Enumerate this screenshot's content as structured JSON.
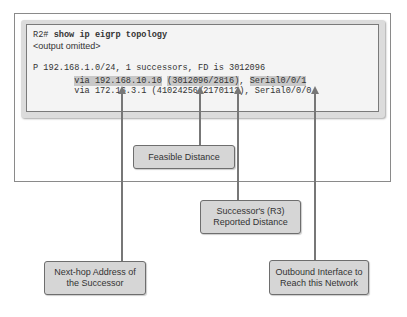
{
  "terminal": {
    "prompt": "R2#",
    "command": " show ip eigrp topology",
    "omitted": "<output omitted>",
    "route_line": "P 192.168.1.0/24, 1 successors, FD is 3012096",
    "successor_line": {
      "indent": "        ",
      "via": "via 192.168.10.10",
      "space1": " ",
      "metrics": "(3012096/2816)",
      "comma": ", ",
      "interface": "Serial0/0/1"
    },
    "feasible_line": "        via 172.16.3.1 (41024256/2170112), Serial0/0/0"
  },
  "callouts": {
    "feasible_distance": "Feasible Distance",
    "reported_distance_1": "Successor's (R3)",
    "reported_distance_2": "Reported Distance",
    "next_hop_1": "Next-hop Address of",
    "next_hop_2": "the Successor",
    "outbound_1": "Outbound Interface to",
    "outbound_2": "Reach this Network"
  },
  "colors": {
    "highlight": "#c8c8c8",
    "callout_fill": "#d6d6d6",
    "arrow": "#777777"
  }
}
